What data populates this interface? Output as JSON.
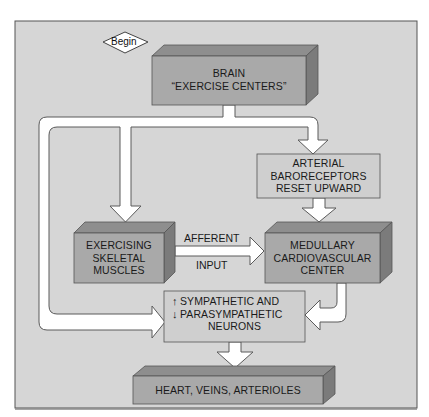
{
  "diagram": {
    "start": {
      "label": "Begin"
    },
    "nodes": {
      "brain": {
        "line1": "BRAIN",
        "line2": "“EXERCISE CENTERS”"
      },
      "baroreceptors": {
        "line1": "ARTERIAL",
        "line2": "BARORECEPTORS",
        "line3": "RESET UPWARD"
      },
      "muscles": {
        "line1": "EXERCISING",
        "line2": "SKELETAL",
        "line3": "MUSCLES"
      },
      "medullary": {
        "line1": "MEDULLARY",
        "line2": "CARDIOVASCULAR",
        "line3": "CENTER"
      },
      "neurons": {
        "up_icon": "↑",
        "down_icon": "↓",
        "line1": "SYMPATHETIC AND",
        "line2": "PARASYMPATHETIC",
        "line3": "NEURONS"
      },
      "effectors": {
        "line1": "HEART, VEINS, ARTERIOLES"
      }
    },
    "edges": {
      "afferent": {
        "label_top": "AFFERENT",
        "label_bottom": "INPUT"
      }
    },
    "colors": {
      "background": "#d6d6d6",
      "box_front": "#a9a9a9",
      "box_top": "#8e8e8e",
      "box_side": "#7b7b7b",
      "flat_box": "#cfcfcf",
      "arrow_fill": "#ffffff",
      "outline": "#5a5a5a"
    }
  }
}
